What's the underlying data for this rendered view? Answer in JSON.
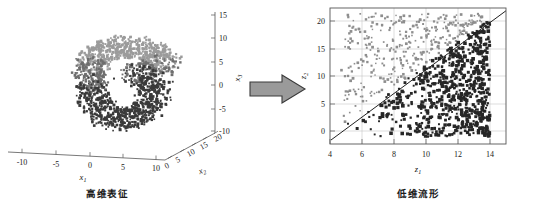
{
  "figure": {
    "background": "#ffffff",
    "width": 536,
    "height": 211
  },
  "captions": {
    "left": "高维表征",
    "right": "低维流形"
  },
  "arrow": {
    "name": "transform-arrow",
    "direction": "right",
    "fill": "#9a9a9a",
    "stroke": "#3a3a3a"
  },
  "left_panel": {
    "title": "",
    "type": "scatter3d",
    "axes": {
      "x1": {
        "label": "x",
        "sub": "1",
        "ticks": [
          "-10",
          "-5",
          "0",
          "5",
          "10"
        ]
      },
      "x2": {
        "label": "x",
        "sub": "2",
        "ticks": [
          "0",
          "5",
          "10",
          "15",
          "20"
        ]
      },
      "x3": {
        "label": "x",
        "sub": "3",
        "ticks": [
          "15",
          "10",
          "5",
          "0",
          "-5",
          "-10"
        ]
      }
    },
    "point_colors": [
      "#3a3a3a",
      "#6e6e6e",
      "#9b9b9b"
    ]
  },
  "right_panel": {
    "type": "scatter",
    "axes": {
      "z1": {
        "label": "z",
        "sub": "1",
        "ticks": [
          "4",
          "6",
          "8",
          "10",
          "12",
          "14"
        ],
        "range": [
          3.6,
          14.6
        ]
      },
      "z2": {
        "label": "z",
        "sub": "2",
        "ticks": [
          "0",
          "5",
          "10",
          "15",
          "20"
        ],
        "range": [
          -2.2,
          22.5
        ]
      }
    },
    "grid": true,
    "separator_line": {
      "from": [
        3.9,
        -1.6
      ],
      "to": [
        14.6,
        21.6
      ],
      "color": "#222222"
    },
    "clusters": [
      {
        "name": "upper-left-light",
        "color": "#8e8e8e"
      },
      {
        "name": "lower-right-dark",
        "color": "#262626"
      }
    ]
  },
  "chart_data": [
    {
      "type": "scatter",
      "title": "高维表征",
      "xlabel": "x1",
      "ylabel": "x2",
      "zlabel": "x3",
      "projection": "3d",
      "xlim": [
        -12,
        13
      ],
      "ylim": [
        0,
        20
      ],
      "zlim": [
        -12,
        16
      ],
      "xticks": [
        -10,
        -5,
        0,
        5,
        10
      ],
      "yticks": [
        0,
        5,
        10,
        15,
        20
      ],
      "zticks": [
        -10,
        -5,
        0,
        5,
        10,
        15
      ],
      "grid": false,
      "legend": null,
      "description": "Swiss-roll / twisted toroidal manifold of densely packed points in 3D, colored in dark and mid grays",
      "series": [
        {
          "name": "manifold-dark",
          "color": "#3a3a3a",
          "n_points": 900
        },
        {
          "name": "manifold-light",
          "color": "#8f8f8f",
          "n_points": 350
        }
      ]
    },
    {
      "type": "scatter",
      "title": "低维流形",
      "xlabel": "z1",
      "ylabel": "z2",
      "xlim": [
        3.6,
        14.6
      ],
      "ylim": [
        -2.2,
        22.5
      ],
      "xticks": [
        4,
        6,
        8,
        10,
        12,
        14
      ],
      "yticks": [
        0,
        5,
        10,
        15,
        20
      ],
      "grid": true,
      "legend": null,
      "annotations": [
        {
          "type": "line",
          "x": [
            3.9,
            14.6
          ],
          "y": [
            -1.6,
            21.6
          ],
          "color": "#222222"
        }
      ],
      "series": [
        {
          "name": "class-light",
          "color": "#8e8e8e",
          "region": "above-diagonal",
          "n_points": 620
        },
        {
          "name": "class-dark",
          "color": "#262626",
          "region": "below-diagonal",
          "n_points": 780
        }
      ]
    }
  ]
}
